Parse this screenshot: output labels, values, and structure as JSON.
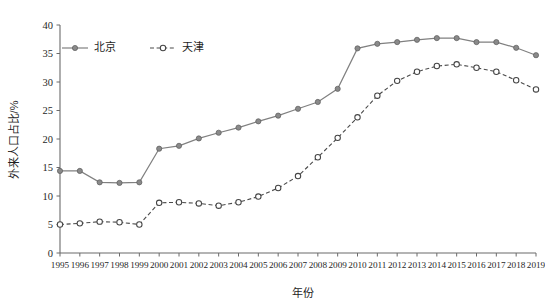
{
  "chart_data": {
    "type": "line",
    "title": "",
    "xlabel": "年份",
    "ylabel": "外来人口占比/%",
    "xlim": [
      1995,
      2019
    ],
    "ylim": [
      0,
      40
    ],
    "yticks": [
      0,
      5,
      10,
      15,
      20,
      25,
      30,
      35,
      40
    ],
    "grid": false,
    "legend_position": "top-left",
    "categories": [
      "1995",
      "1996",
      "1997",
      "1998",
      "1999",
      "2000",
      "2001",
      "2002",
      "2003",
      "2004",
      "2005",
      "2006",
      "2007",
      "2008",
      "2009",
      "2010",
      "2011",
      "2012",
      "2013",
      "2014",
      "2015",
      "2016",
      "2017",
      "2018",
      "2019"
    ],
    "series": [
      {
        "name": "北京",
        "marker": "filled-circle",
        "line_style": "solid",
        "color": "#808080",
        "values": [
          14.4,
          14.4,
          12.4,
          12.3,
          12.4,
          18.3,
          18.8,
          20.1,
          21.1,
          22.0,
          23.1,
          24.1,
          25.3,
          26.5,
          28.8,
          35.9,
          36.7,
          37.0,
          37.4,
          37.7,
          37.7,
          37.0,
          37.0,
          36.0,
          34.7
        ]
      },
      {
        "name": "天津",
        "marker": "hollow-circle",
        "line_style": "dashed",
        "color": "#444444",
        "values": [
          5.0,
          5.2,
          5.5,
          5.4,
          5.0,
          8.8,
          8.9,
          8.7,
          8.3,
          8.9,
          9.9,
          11.4,
          13.5,
          16.8,
          20.2,
          23.8,
          27.6,
          30.2,
          31.8,
          32.8,
          33.1,
          32.5,
          31.8,
          30.3,
          28.7
        ]
      }
    ]
  },
  "legend": {
    "items": [
      {
        "label": "北京"
      },
      {
        "label": "天津"
      }
    ]
  },
  "axes": {
    "y_title": "外来人口占比/%",
    "x_title": "年份",
    "y_tick_labels": [
      "0",
      "5",
      "10",
      "15",
      "20",
      "25",
      "30",
      "35",
      "40"
    ],
    "x_tick_labels": [
      "1995",
      "1996",
      "1997",
      "1998",
      "1999",
      "2000",
      "2001",
      "2002",
      "2003",
      "2004",
      "2005",
      "2006",
      "2007",
      "2008",
      "2009",
      "2010",
      "2011",
      "2012",
      "2013",
      "2014",
      "2015",
      "2016",
      "2017",
      "2018",
      "2019"
    ]
  },
  "colors": {
    "beijing": "#808080",
    "tianjin": "#444444",
    "axis": "#6b6b6b",
    "background": "#ffffff"
  }
}
